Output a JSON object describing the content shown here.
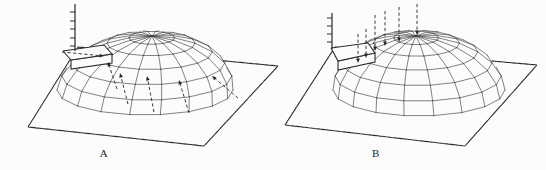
{
  "figure": {
    "width": 546,
    "height": 170,
    "style": {
      "background": "#fcfcfa",
      "ink": "#2b2b2b",
      "mesh_ink": "#3f3f3f",
      "arrow_ink": "#262626",
      "dash_pattern": [
        3.2,
        2.4
      ]
    },
    "panels": [
      {
        "label": "A",
        "label_pos": {
          "x": 104,
          "y": 153
        },
        "plane": [
          [
            28,
            127
          ],
          [
            78,
            47
          ],
          [
            278,
            66
          ],
          [
            204,
            146
          ]
        ],
        "dome": {
          "cx": 145,
          "cy": 90,
          "rx": 88,
          "ry": 25,
          "height": 54,
          "apex_skew": 7,
          "meridians": 18,
          "rings": 5
        },
        "axis": {
          "x": 75,
          "y_top": 4,
          "y_bottom": 51,
          "ticks": [
            12,
            21,
            29,
            38,
            46
          ],
          "tick_len": 5
        },
        "box": {
          "top": [
            [
              63,
              51
            ],
            [
              104,
              45
            ],
            [
              112,
              54
            ],
            [
              71,
              60
            ]
          ],
          "drop": 9
        },
        "arrows": [
          {
            "tail": [
              62,
              52
            ],
            "head": [
              104,
              56
            ]
          },
          {
            "tail": [
              117,
              89
            ],
            "head": [
              108,
              62
            ]
          },
          {
            "tail": [
              128,
              104
            ],
            "head": [
              120,
              73
            ]
          },
          {
            "tail": [
              154,
              112
            ],
            "head": [
              147,
              76
            ]
          },
          {
            "tail": [
              189,
              113
            ],
            "head": [
              179,
              80
            ]
          },
          {
            "tail": [
              238,
              98
            ],
            "head": [
              212,
              76
            ]
          }
        ]
      },
      {
        "label": "B",
        "label_pos": {
          "x": 376,
          "y": 153
        },
        "plane": [
          [
            285,
            125
          ],
          [
            335,
            47
          ],
          [
            537,
            65
          ],
          [
            465,
            146
          ]
        ],
        "dome": {
          "cx": 419,
          "cy": 90,
          "rx": 86,
          "ry": 26,
          "height": 54,
          "apex_skew": -3,
          "meridians": 18,
          "rings": 5
        },
        "axis": {
          "x": 332,
          "y_top": 13,
          "y_bottom": 49,
          "ticks": [
            18,
            26,
            34,
            42
          ],
          "tick_len": 5
        },
        "box": {
          "top": [
            [
              331,
              48
            ],
            [
              368,
              43
            ],
            [
              375,
              53
            ],
            [
              338,
              61
            ]
          ],
          "drop": 9
        },
        "arrows": [
          {
            "tail": [
              358,
              34
            ],
            "head": [
              358,
              63
            ]
          },
          {
            "tail": [
              366,
              29
            ],
            "head": [
              366,
              58
            ]
          },
          {
            "tail": [
              375,
              15
            ],
            "head": [
              375,
              51
            ]
          },
          {
            "tail": [
              385,
              11
            ],
            "head": [
              385,
              46
            ]
          },
          {
            "tail": [
              399,
              7
            ],
            "head": [
              399,
              42
            ]
          },
          {
            "tail": [
              417,
              4
            ],
            "head": [
              417,
              35
            ]
          }
        ]
      }
    ]
  }
}
